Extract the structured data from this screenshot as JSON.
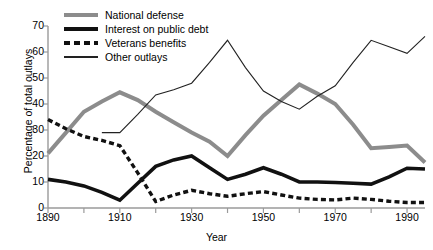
{
  "chart_data": {
    "type": "line",
    "title": "",
    "xlabel": "Year",
    "ylabel": "Percentage of total outlays",
    "xlim": [
      1890,
      1995
    ],
    "ylim": [
      0,
      70
    ],
    "grid": false,
    "legend_position": "top-left",
    "x_ticks": [
      1890,
      1910,
      1930,
      1950,
      1970,
      1990
    ],
    "x_minor_ticks": [
      1900,
      1920,
      1940,
      1960,
      1980
    ],
    "y_ticks": [
      0,
      10,
      20,
      30,
      40,
      50,
      60,
      70
    ],
    "x": [
      1890,
      1895,
      1900,
      1905,
      1910,
      1915,
      1920,
      1925,
      1930,
      1935,
      1940,
      1945,
      1950,
      1955,
      1960,
      1965,
      1970,
      1975,
      1980,
      1985,
      1990,
      1995
    ],
    "series": [
      {
        "name": "National defense",
        "style": "thick-gray",
        "color": "#8c8c8c",
        "x": [
          1890,
          1895,
          1900,
          1905,
          1910,
          1915,
          1920,
          1925,
          1930,
          1935,
          1940,
          1945,
          1950,
          1955,
          1960,
          1965,
          1970,
          1975,
          1980,
          1985,
          1990,
          1995
        ],
        "values": [
          21,
          29,
          37,
          41,
          44.5,
          41.5,
          37,
          33,
          29,
          25.5,
          20,
          28,
          35.5,
          41.5,
          47.5,
          44,
          40,
          32,
          23,
          23.5,
          24,
          17.5
        ]
      },
      {
        "name": "Interest on public debt",
        "style": "thick-black",
        "color": "#111111",
        "x": [
          1890,
          1895,
          1900,
          1905,
          1910,
          1915,
          1920,
          1925,
          1930,
          1935,
          1940,
          1945,
          1950,
          1955,
          1960,
          1965,
          1970,
          1975,
          1980,
          1985,
          1990,
          1995
        ],
        "values": [
          11,
          10,
          8.5,
          6,
          3,
          9.5,
          16,
          18.5,
          20,
          15.5,
          11,
          13,
          15.5,
          13,
          10,
          10,
          9.8,
          9.5,
          9.2,
          12,
          15.3,
          15
        ]
      },
      {
        "name": "Veterans benefits",
        "style": "dashed-black",
        "color": "#111111",
        "x": [
          1890,
          1895,
          1900,
          1905,
          1910,
          1915,
          1920,
          1925,
          1930,
          1935,
          1940,
          1945,
          1950,
          1955,
          1960,
          1965,
          1970,
          1975,
          1980,
          1985,
          1990,
          1995
        ],
        "values": [
          34,
          30.5,
          27.5,
          26,
          24,
          13.5,
          2.5,
          5,
          6.8,
          5.5,
          4.5,
          5.5,
          6.3,
          5,
          3.8,
          3.3,
          3.1,
          3.8,
          3.3,
          2.6,
          2.1,
          2.1
        ]
      },
      {
        "name": "Other outlays",
        "style": "thin-black",
        "color": "#222222",
        "x": [
          1905,
          1910,
          1915,
          1920,
          1925,
          1930,
          1935,
          1940,
          1945,
          1950,
          1955,
          1960,
          1965,
          1970,
          1975,
          1980,
          1985,
          1990,
          1995
        ],
        "values": [
          29,
          29,
          36,
          43.5,
          45.5,
          48,
          56,
          64.5,
          54,
          45,
          41,
          38,
          43,
          47,
          56,
          64.5,
          62,
          59.5,
          66
        ]
      }
    ]
  },
  "legend": {
    "items": [
      {
        "label": "National defense",
        "swatch": "thick-gray-line-icon"
      },
      {
        "label": "Interest on public debt",
        "swatch": "thick-black-line-icon"
      },
      {
        "label": "Veterans benefits",
        "swatch": "dashed-black-line-icon"
      },
      {
        "label": "Other outlays",
        "swatch": "thin-black-line-icon"
      }
    ]
  },
  "axes": {
    "x_title": "Year",
    "y_title": "Percentage of total outlays",
    "x_tick_labels": [
      "1890",
      "1910",
      "1930",
      "1950",
      "1970",
      "1990"
    ],
    "y_tick_labels": [
      "0",
      "10",
      "20",
      "30",
      "40",
      "50",
      "60",
      "70"
    ]
  }
}
